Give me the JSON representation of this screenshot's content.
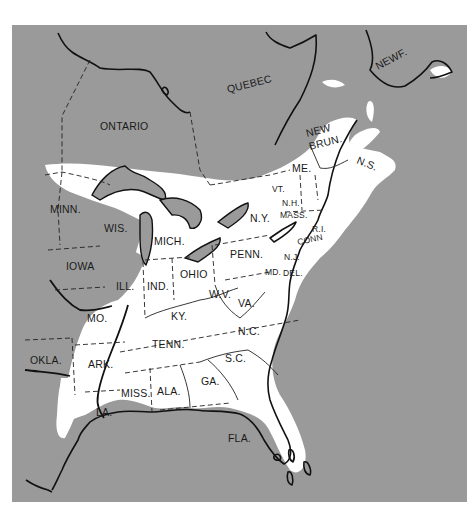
{
  "map": {
    "background_color": "#9a9a9a",
    "range_color": "#ffffff",
    "line_color": "#111111",
    "frame": {
      "x": 12,
      "y": 25,
      "width": 455,
      "height": 477
    }
  },
  "labels": {
    "canada": {
      "ontario": "ONTARIO",
      "quebec": "QUEBEC",
      "new_brunswick_line1": "NEW",
      "new_brunswick_line2": "BRUN.",
      "nova_scotia": "N.S.",
      "newfoundland": "NEWF."
    },
    "states": {
      "minn": "MINN.",
      "wis": "WIS.",
      "mich": "MICH.",
      "iowa": "IOWA",
      "ill": "ILL.",
      "ind": "IND.",
      "ohio": "OHIO",
      "penn": "PENN.",
      "ny": "N.Y.",
      "vt": "VT.",
      "nh": "N.H.",
      "me": "ME.",
      "mass": "MASS.",
      "ri": "R.I.",
      "conn": "CONN",
      "nj": "N.J.",
      "md": "MD.",
      "del": "DEL.",
      "wv": "W.V.",
      "va": "VA.",
      "ky": "KY.",
      "mo": "MO.",
      "okla": "OKLA.",
      "ark": "ARK.",
      "tenn": "TENN.",
      "nc": "N.C.",
      "sc": "S.C.",
      "ga": "GA.",
      "ala": "ALA.",
      "miss": "MISS.",
      "la": "LA.",
      "fla": "FLA."
    }
  }
}
